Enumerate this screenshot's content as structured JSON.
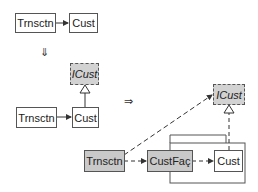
{
  "diagram": {
    "step1": {
      "client": "Trnsctn",
      "supplier": "Cust"
    },
    "down_arrow": "⇓",
    "step2": {
      "interface": "ICust",
      "client": "Trnsctn",
      "supplier": "Cust"
    },
    "right_arrow": "⇒",
    "step3": {
      "interface": "ICust",
      "client": "Trnsctn",
      "facade": "CustFaç",
      "supplier": "Cust"
    }
  }
}
